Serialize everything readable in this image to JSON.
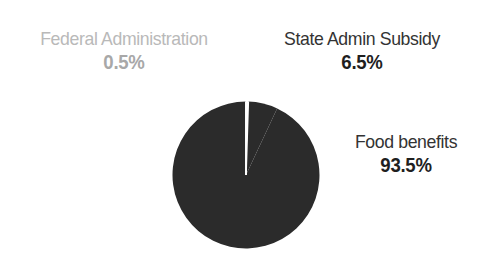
{
  "figure": {
    "background_color": "#ffffff",
    "width": 484,
    "height": 274
  },
  "chart_data": {
    "type": "pie",
    "title": "",
    "subtitle": "",
    "xlabel": "",
    "ylabel": "",
    "grid": false,
    "legend_position": "none",
    "labels_position": "outside",
    "start_angle_deg": 0,
    "direction": "counterclockwise",
    "categories": [
      "Food benefits",
      "State Admin Subsidy",
      "Federal Administration"
    ],
    "values": [
      93.5,
      6.5,
      0.5
    ],
    "value_unit": "%",
    "slices": [
      {
        "name": "Food benefits",
        "value": 93.5,
        "display_value": "93.5%",
        "color": "#2b2b2b",
        "label_color": "#333333",
        "value_color": "#1f1f1f"
      },
      {
        "name": "State Admin Subsidy",
        "value": 6.5,
        "display_value": "6.5%",
        "color": "#2b2b2b",
        "label_color": "#333333",
        "value_color": "#1f1f1f"
      },
      {
        "name": "Federal Administration",
        "value": 0.5,
        "display_value": "0.5%",
        "color": "#ffffff",
        "label_color": "#b9b9b9",
        "value_color": "#a8a8a8"
      }
    ],
    "slice_separator_color": "#ffffff",
    "annotations": []
  },
  "labels": {
    "federal": {
      "name": "Federal Administration",
      "percent": "0.5%"
    },
    "state": {
      "name": "State Admin Subsidy",
      "percent": "6.5%"
    },
    "food": {
      "name": "Food benefits",
      "percent": "93.5%"
    }
  },
  "colors": {
    "pie_fill": "#2b2b2b",
    "separator": "#ffffff",
    "muted_text": "#b9b9b9",
    "dark_text": "#333333",
    "value_text": "#1f1f1f",
    "background": "#ffffff"
  }
}
